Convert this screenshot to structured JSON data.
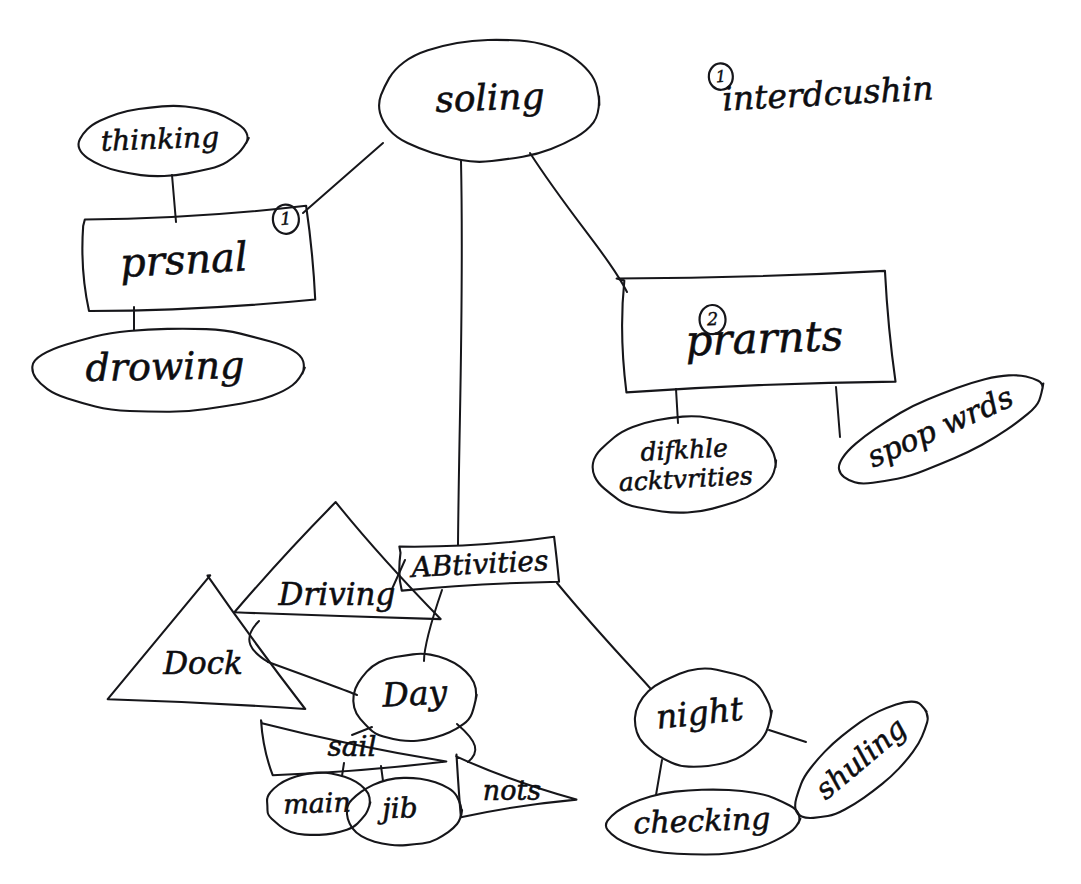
{
  "document": {
    "kind": "hand-drawn-mind-map",
    "title": "soling",
    "background_color": "#ffffff",
    "ink_color": "#16161a"
  },
  "annotations": [
    {
      "id": "annotation-introduction",
      "badge": "1",
      "text": "interdcushin",
      "x": 828,
      "y": 96,
      "font_size": 33,
      "rotation": -3,
      "badge_x": 722,
      "badge_y": 71,
      "badge_r": 12
    }
  ],
  "nodes": [
    {
      "id": "node-soling",
      "label": "soling",
      "shape": "ellipse",
      "cx": 490,
      "cy": 100,
      "rx": 112,
      "ry": 62,
      "rotation": -2,
      "font_size": 36,
      "text_x": 490,
      "text_y": 101,
      "badge": null
    },
    {
      "id": "node-thinking",
      "label": "thinking",
      "shape": "ellipse",
      "cx": 163,
      "cy": 141,
      "rx": 84,
      "ry": 35,
      "rotation": -2,
      "font_size": 28,
      "text_x": 160,
      "text_y": 141,
      "badge": null
    },
    {
      "id": "node-prsnal",
      "label": "prsnal",
      "shape": "rect",
      "cx": 196,
      "cy": 262,
      "w": 226,
      "h": 92,
      "rotation": -3,
      "font_size": 40,
      "text_x": 184,
      "text_y": 263,
      "badge": "1",
      "badge_x": 288,
      "badge_y": 224,
      "badge_r": 13
    },
    {
      "id": "node-drowing",
      "label": "drowing",
      "shape": "ellipse",
      "cx": 168,
      "cy": 370,
      "rx": 137,
      "ry": 42,
      "rotation": -1,
      "font_size": 38,
      "text_x": 165,
      "text_y": 370,
      "badge": null
    },
    {
      "id": "node-prarnts",
      "label": "prarnts",
      "shape": "rect",
      "cx": 757,
      "cy": 332,
      "w": 268,
      "h": 108,
      "rotation": -2,
      "font_size": 42,
      "text_x": 764,
      "text_y": 342,
      "badge": "2",
      "badge_x": 713,
      "badge_y": 318,
      "badge_r": 13
    },
    {
      "id": "node-difkhle-acktvrities",
      "label": "difkhle",
      "label2": "acktvrities",
      "shape": "ellipse",
      "cx": 685,
      "cy": 465,
      "rx": 92,
      "ry": 48,
      "rotation": -3,
      "font_size": 25,
      "text_x": 685,
      "text_y": 452,
      "text2_y": 481,
      "badge": null
    },
    {
      "id": "node-spop-wrds",
      "label": "spop wrds",
      "shape": "ellipse",
      "cx": 941,
      "cy": 429,
      "rx": 112,
      "ry": 33,
      "rotation": -24,
      "font_size": 30,
      "text_x": 941,
      "text_y": 429,
      "badge": null
    },
    {
      "id": "node-activities",
      "label": "ABtivities",
      "shape": "rect",
      "cx": 480,
      "cy": 566,
      "w": 160,
      "h": 44,
      "rotation": -3,
      "font_size": 28,
      "text_x": 480,
      "text_y": 566,
      "badge": null
    },
    {
      "id": "node-driving",
      "label": "Driving",
      "shape": "triangle",
      "cx": 337,
      "cy": 563,
      "w": 200,
      "h": 116,
      "rotation": 0,
      "font_size": 31,
      "text_x": 337,
      "text_y": 596,
      "badge": null
    },
    {
      "id": "node-dock",
      "label": "Dock",
      "shape": "triangle",
      "cx": 205,
      "cy": 641,
      "w": 198,
      "h": 132,
      "rotation": 0,
      "font_size": 31,
      "text_x": 203,
      "text_y": 665,
      "badge": null
    },
    {
      "id": "node-day",
      "label": "Day",
      "shape": "ellipse",
      "cx": 415,
      "cy": 698,
      "rx": 62,
      "ry": 44,
      "rotation": -3,
      "font_size": 33,
      "text_x": 415,
      "text_y": 696,
      "badge": null
    },
    {
      "id": "node-sail",
      "label": "sail",
      "shape": "triangle-right",
      "cx": 355,
      "cy": 750,
      "w": 190,
      "h": 58,
      "rotation": 0,
      "font_size": 28,
      "text_x": 352,
      "text_y": 748,
      "badge": null
    },
    {
      "id": "node-main",
      "label": "main",
      "shape": "ellipse",
      "cx": 318,
      "cy": 804,
      "rx": 52,
      "ry": 32,
      "rotation": -2,
      "font_size": 27,
      "text_x": 317,
      "text_y": 805,
      "badge": null
    },
    {
      "id": "node-jib",
      "label": "jib",
      "shape": "ellipse",
      "cx": 405,
      "cy": 812,
      "rx": 58,
      "ry": 34,
      "rotation": -2,
      "font_size": 28,
      "text_x": 400,
      "text_y": 810,
      "badge": null
    },
    {
      "id": "node-nots",
      "label": "nots",
      "shape": "triangle-right",
      "cx": 513,
      "cy": 789,
      "w": 120,
      "h": 62,
      "rotation": 0,
      "font_size": 27,
      "text_x": 512,
      "text_y": 792,
      "badge": null
    },
    {
      "id": "node-night",
      "label": "night",
      "shape": "ellipse",
      "cx": 703,
      "cy": 718,
      "rx": 68,
      "ry": 49,
      "rotation": -6,
      "font_size": 33,
      "text_x": 700,
      "text_y": 715,
      "badge": null
    },
    {
      "id": "node-checking",
      "label": "checking",
      "shape": "ellipse",
      "cx": 703,
      "cy": 822,
      "rx": 97,
      "ry": 33,
      "rotation": -2,
      "font_size": 30,
      "text_x": 702,
      "text_y": 823,
      "badge": null
    },
    {
      "id": "node-shuling",
      "label": "shuling",
      "shape": "ellipse",
      "cx": 862,
      "cy": 760,
      "rx": 83,
      "ry": 32,
      "rotation": -40,
      "font_size": 29,
      "text_x": 862,
      "text_y": 760,
      "badge": null
    }
  ],
  "edges": [
    {
      "id": "edge-soling-prsnal",
      "from": "node-soling",
      "to": "node-prsnal",
      "path": "M 383 143 L 303 213"
    },
    {
      "id": "edge-soling-activities",
      "from": "node-soling",
      "to": "node-activities",
      "path": "M 461 161 C 464 300 459 420 458 545"
    },
    {
      "id": "edge-soling-prarnts",
      "from": "node-soling",
      "to": "node-prarnts",
      "path": "M 530 153 C 570 215 610 258 627 292"
    },
    {
      "id": "edge-thinking-prsnal",
      "from": "node-thinking",
      "to": "node-prsnal",
      "path": "M 172 175 L 176 222"
    },
    {
      "id": "edge-prsnal-drowing",
      "from": "node-prsnal",
      "to": "node-drowing",
      "path": "M 134 307 L 134 330"
    },
    {
      "id": "edge-prarnts-difkhle",
      "from": "node-prarnts",
      "to": "node-difkhle-acktvrities",
      "path": "M 676 389 L 678 423"
    },
    {
      "id": "edge-prarnts-spop",
      "from": "node-prarnts",
      "to": "node-spop-wrds",
      "path": "M 836 387 L 840 437"
    },
    {
      "id": "edge-activities-driving",
      "from": "node-activities",
      "to": "node-driving",
      "path": "M 405 560 L 392 589"
    },
    {
      "id": "edge-activities-day",
      "from": "node-activities",
      "to": "node-day",
      "path": "M 442 590 C 430 625 424 648 424 661"
    },
    {
      "id": "edge-activities-night",
      "from": "node-activities",
      "to": "node-night",
      "path": "M 557 583 C 600 635 636 672 650 688"
    },
    {
      "id": "edge-driving-dock",
      "from": "node-driving",
      "to": "node-dock",
      "path": "M 259 621 C 240 640 252 652 268 662"
    },
    {
      "id": "edge-dock-day",
      "from": "node-dock",
      "to": "node-day",
      "path": "M 268 662 C 312 678 345 690 357 695"
    },
    {
      "id": "edge-day-sail",
      "from": "node-day",
      "to": "node-sail",
      "path": "M 372 727 L 352 735"
    },
    {
      "id": "edge-sail-main",
      "from": "node-sail",
      "to": "node-main",
      "path": "M 344 763 L 342 776"
    },
    {
      "id": "edge-sail-jib",
      "from": "node-sail",
      "to": "node-jib",
      "path": "M 381 766 L 383 781"
    },
    {
      "id": "edge-day-nots",
      "from": "node-day",
      "to": "node-nots",
      "path": "M 457 724 C 478 742 480 752 468 762"
    },
    {
      "id": "edge-night-checking",
      "from": "node-night",
      "to": "node-checking",
      "path": "M 662 760 L 656 795"
    },
    {
      "id": "edge-night-shuling",
      "from": "node-night",
      "to": "node-shuling",
      "path": "M 769 730 L 806 742"
    }
  ]
}
